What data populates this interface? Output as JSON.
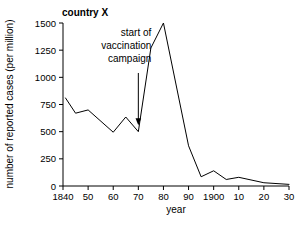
{
  "chart_data": {
    "type": "line",
    "title": "country X",
    "xlabel": "year",
    "ylabel": "number of reported cases (per million)",
    "xlim": [
      1840,
      1930
    ],
    "ylim": [
      0,
      1500
    ],
    "grid": false,
    "legend": null,
    "x_tick_values": [
      1840,
      1850,
      1860,
      1870,
      1880,
      1890,
      1900,
      1910,
      1920,
      1930
    ],
    "x_tick_labels": [
      "1840",
      "50",
      "60",
      "70",
      "80",
      "90",
      "1900",
      "10",
      "20",
      "30"
    ],
    "y_tick_values": [
      0,
      250,
      500,
      750,
      1000,
      1250,
      1500
    ],
    "y_tick_labels": [
      "0",
      "250",
      "500",
      "750",
      "1000",
      "1250",
      "1500"
    ],
    "series": [
      {
        "name": "reported cases",
        "x": [
          1841,
          1845,
          1850,
          1860,
          1865,
          1870,
          1875,
          1880,
          1890,
          1895,
          1900,
          1905,
          1910,
          1920,
          1930
        ],
        "values": [
          810,
          670,
          700,
          495,
          635,
          500,
          1270,
          1500,
          370,
          85,
          140,
          60,
          80,
          30,
          15
        ]
      }
    ],
    "annotations": [
      {
        "text_lines": [
          "start of",
          "vaccination",
          "campaign"
        ],
        "arrow_x": 1870,
        "arrow_y_value": 560,
        "arrow_top_value": 1040
      }
    ]
  },
  "labels": {
    "title": "country X",
    "xlabel": "year",
    "ylabel": "number of reported cases (per million)",
    "annotation_line1": "start of",
    "annotation_line2": "vaccination",
    "annotation_line3": "campaign"
  }
}
